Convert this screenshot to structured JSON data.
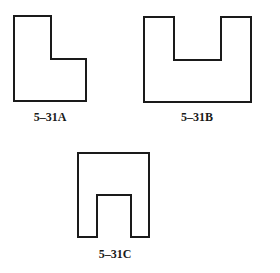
{
  "figures": [
    {
      "id": "A",
      "label": "5–31A",
      "shape": "L-shape",
      "points": "14,16 51,16 51,59 86,59 86,101 14,101",
      "label_pos": {
        "x": 50,
        "y": 110
      }
    },
    {
      "id": "B",
      "label": "5–31B",
      "shape": "U-shape",
      "points": "144,17 174,17 174,60 221,60 221,17 251,17 251,102 144,102",
      "label_pos": {
        "x": 197,
        "y": 110
      }
    },
    {
      "id": "C",
      "label": "5–31C",
      "shape": "arch / inverted-U",
      "points": "78,153 149,153 149,237 131,237 131,195 97,195 97,237 78,237",
      "label_pos": {
        "x": 115,
        "y": 247
      }
    }
  ],
  "colors": {
    "stroke": "#1a1a1a",
    "background": "#ffffff"
  }
}
